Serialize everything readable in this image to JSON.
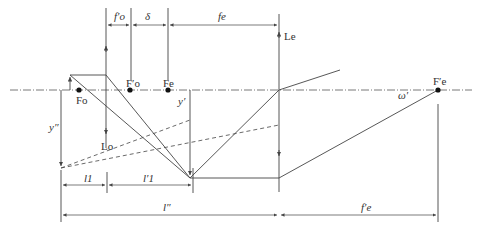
{
  "diagram": {
    "type": "telescope-optical-ray-diagram",
    "colors": {
      "line": "#444444",
      "dot": "#111111",
      "background": "#ffffff"
    },
    "labels": {
      "fo_prime_dim": "f′o",
      "delta_dim": "δ",
      "fe_dim": "fe",
      "Le": "Le",
      "Lo": "Lo",
      "Fo": "Fo",
      "Fo_prime": "F′o",
      "Fe": "Fe",
      "Fe_prime": "F′e",
      "y_prime": "y′",
      "y_double_prime": "y″",
      "omega_prime": "ω′",
      "l1": "l1",
      "l1_prime": "l′1",
      "l_double_prime": "l″",
      "fe_prime_dim": "f′e"
    }
  }
}
